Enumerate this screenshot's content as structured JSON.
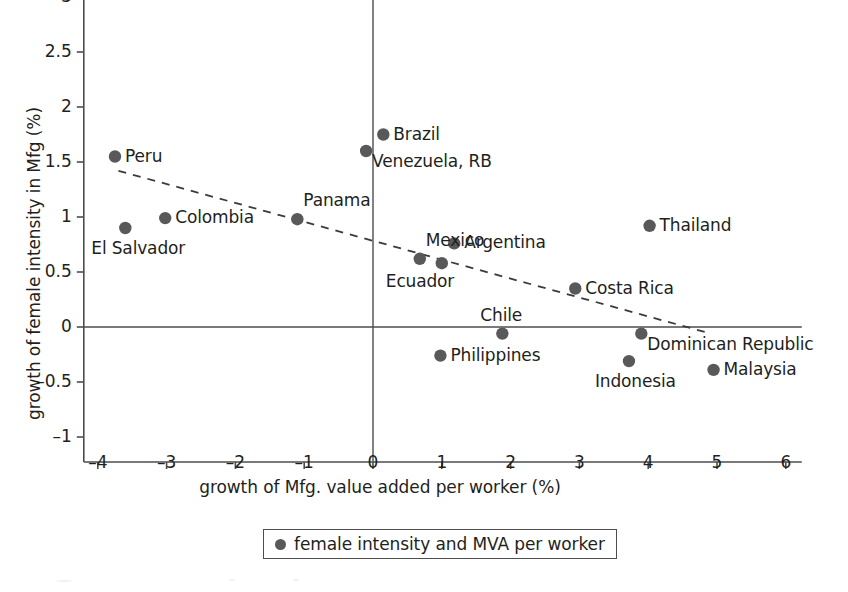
{
  "chart_data": {
    "type": "scatter",
    "title": "",
    "xlabel": "growth of Mfg. value added per worker (%)",
    "ylabel": "growth of female intensity in Mfg (%)",
    "xlim": [
      -4.3,
      6.3
    ],
    "ylim": [
      -1.25,
      3.15
    ],
    "xticks": [
      -4,
      -3,
      -2,
      -1,
      0,
      1,
      2,
      3,
      4,
      5,
      6
    ],
    "xtick_labels": [
      "-4",
      "-3",
      "-2",
      "-1",
      "0",
      "1",
      "2",
      "3",
      "4",
      "5",
      "6"
    ],
    "yticks": [
      -1,
      -0.5,
      0,
      0.5,
      1,
      1.5,
      2,
      2.5,
      3
    ],
    "ytick_labels": [
      "-1",
      "-0.5",
      "0",
      "0.5",
      "1",
      "1.5",
      "2",
      "2.5",
      "3"
    ],
    "grid": false,
    "marker_color": "#595959",
    "axis_color": "#4d4d4d",
    "legend": {
      "position": "below-axes-center",
      "entries": [
        {
          "label": "female intensity and MVA per worker",
          "marker": "circle",
          "color": "#595959"
        }
      ]
    },
    "points": [
      {
        "name": "Peru",
        "x": -3.75,
        "y": 1.55,
        "label_side": "right"
      },
      {
        "name": "El Salvador",
        "x": -3.6,
        "y": 0.9,
        "label_side": "below"
      },
      {
        "name": "Colombia",
        "x": -3.02,
        "y": 0.99,
        "label_side": "right"
      },
      {
        "name": "Panama",
        "x": -1.1,
        "y": 0.98,
        "label_side": "above-right"
      },
      {
        "name": "Venezuela, RB",
        "x": -0.1,
        "y": 1.6,
        "label_side": "below-right"
      },
      {
        "name": "Brazil",
        "x": 0.15,
        "y": 1.75,
        "label_side": "right"
      },
      {
        "name": "Mexico",
        "x": 0.68,
        "y": 0.62,
        "label_side": "above-right"
      },
      {
        "name": "Ecuador",
        "x": 1.0,
        "y": 0.58,
        "label_side": "below-left"
      },
      {
        "name": "Argentina",
        "x": 1.18,
        "y": 0.76,
        "label_side": "right"
      },
      {
        "name": "Philippines",
        "x": 0.98,
        "y": -0.26,
        "label_side": "right"
      },
      {
        "name": "Chile",
        "x": 1.88,
        "y": -0.06,
        "label_side": "above"
      },
      {
        "name": "Costa Rica",
        "x": 2.94,
        "y": 0.35,
        "label_side": "right"
      },
      {
        "name": "Indonesia",
        "x": 3.72,
        "y": -0.31,
        "label_side": "below"
      },
      {
        "name": "Dominican Republic",
        "x": 3.9,
        "y": -0.06,
        "label_side": "below-right"
      },
      {
        "name": "Thailand",
        "x": 4.02,
        "y": 0.92,
        "label_side": "right"
      },
      {
        "name": "Malaysia",
        "x": 4.95,
        "y": -0.39,
        "label_side": "right"
      }
    ],
    "trendline": {
      "style": "dashed",
      "x_start": -3.7,
      "y_start": 1.42,
      "x_end": 4.85,
      "y_end": -0.05
    }
  }
}
